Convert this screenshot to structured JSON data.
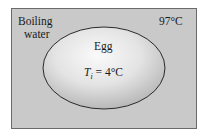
{
  "diagram": {
    "medium_label_line1": "Boiling",
    "medium_label_line2": "water",
    "medium_temperature": "97°C",
    "object_label": "Egg",
    "initial_temp_symbol": "T",
    "initial_temp_subscript": "i",
    "initial_temp_value": " = 4°C",
    "colors": {
      "water": "#c9c9c9",
      "border": "#6a6a6a",
      "egg_center": "#fafafa",
      "egg_edge": "#bdbdbd",
      "egg_outline": "#2a2a2a"
    }
  }
}
